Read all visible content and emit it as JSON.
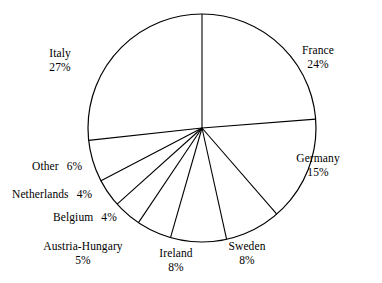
{
  "chart_data": {
    "type": "pie",
    "title": "",
    "subtitle": "",
    "xlabel": "",
    "ylabel": "",
    "legend_position": "none",
    "grid": false,
    "units": "percent",
    "start_angle_deg": 0,
    "direction": "clockwise",
    "center": {
      "x": 202,
      "y": 128
    },
    "radius": 114,
    "stroke_color": "#000000",
    "fill_color": "#ffffff",
    "categories": [
      "France",
      "Germany",
      "Sweden",
      "Ireland",
      "Austria-Hungary",
      "Belgium",
      "Netherlands",
      "Other",
      "Italy"
    ],
    "values": [
      24,
      15,
      8,
      8,
      5,
      4,
      4,
      6,
      27
    ],
    "slices": [
      {
        "name": "France",
        "value": 24,
        "pct_text": "24%",
        "label_layout": "stacked",
        "label_x": 318,
        "label_y": 44
      },
      {
        "name": "Germany",
        "value": 15,
        "pct_text": "15%",
        "label_layout": "stacked",
        "label_x": 318,
        "label_y": 152
      },
      {
        "name": "Sweden",
        "value": 8,
        "pct_text": "8%",
        "label_layout": "stacked",
        "label_x": 247,
        "label_y": 240
      },
      {
        "name": "Ireland",
        "value": 8,
        "pct_text": "8%",
        "label_layout": "stacked",
        "label_x": 176,
        "label_y": 247
      },
      {
        "name": "Austria-Hungary",
        "value": 5,
        "pct_text": "5%",
        "label_layout": "stacked",
        "label_x": 83,
        "label_y": 240
      },
      {
        "name": "Belgium",
        "value": 4,
        "pct_text": "4%",
        "label_layout": "inline",
        "label_x": 53,
        "label_y": 211
      },
      {
        "name": "Netherlands",
        "value": 4,
        "pct_text": "4%",
        "label_layout": "inline",
        "label_x": 12,
        "label_y": 188
      },
      {
        "name": "Other",
        "value": 6,
        "pct_text": "6%",
        "label_layout": "inline",
        "label_x": 32,
        "label_y": 160
      },
      {
        "name": "Italy",
        "value": 27,
        "pct_text": "27%",
        "label_layout": "stacked",
        "label_x": 60,
        "label_y": 47
      }
    ]
  }
}
